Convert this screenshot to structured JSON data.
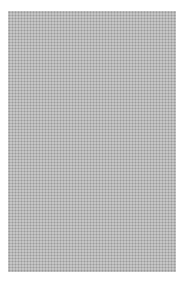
{
  "image": {
    "description": "halftone dot pattern swatch",
    "background_color": "#ffffff",
    "dot_color": "#8a8a8a",
    "pattern_region": {
      "x": 8,
      "y": 11,
      "width": 168,
      "height": 261
    }
  }
}
